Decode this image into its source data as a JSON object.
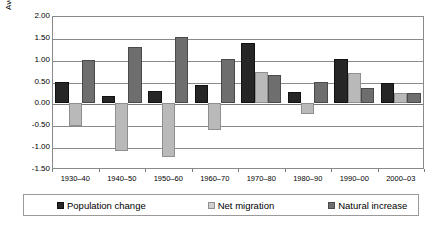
{
  "chart_data": {
    "type": "bar",
    "title": "",
    "xlabel": "",
    "ylabel": "Average annual percent change",
    "ylim": [
      -1.5,
      2.0
    ],
    "ytick_step": 0.5,
    "ytick_labels": [
      "2.00",
      "1.50",
      "1.00",
      "0.50",
      "0.00",
      "-0.50",
      "-1.00",
      "-1.50"
    ],
    "ytick_values": [
      2.0,
      1.5,
      1.0,
      0.5,
      0.0,
      -0.5,
      -1.0,
      -1.5
    ],
    "grid": true,
    "legend_position": "bottom",
    "categories": [
      "1930–40",
      "1940–50",
      "1950–60",
      "1960–70",
      "1970–80",
      "1980–90",
      "1990–00",
      "2000–03"
    ],
    "series": [
      {
        "name": "Population change",
        "color": "#262626",
        "values": [
          0.48,
          0.16,
          0.29,
          0.42,
          1.38,
          0.26,
          1.02,
          0.47
        ]
      },
      {
        "name": "Net migration",
        "color": "#b9b9b9",
        "values": [
          -0.52,
          -1.08,
          -1.23,
          -0.6,
          0.73,
          -0.25,
          0.7,
          0.23
        ]
      },
      {
        "name": "Natural increase",
        "color": "#6e6e6e",
        "values": [
          1.0,
          1.28,
          1.52,
          1.01,
          0.65,
          0.5,
          0.35,
          0.23
        ]
      }
    ]
  }
}
